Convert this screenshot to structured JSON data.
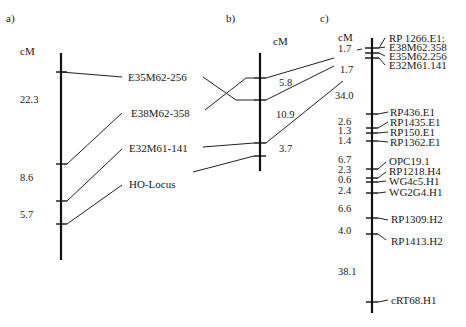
{
  "figure": {
    "panels": [
      {
        "id": "a",
        "label": "a)",
        "unit": "cM",
        "intervals": [
          "22.3",
          "8.6",
          "5.7"
        ],
        "markers": [
          "E35M62-256",
          "E38M62-358",
          "E32M61-141",
          "HO-Locus"
        ]
      },
      {
        "id": "b",
        "label": "b)",
        "unit": "cM",
        "intervals": [
          "5.8",
          "10.9",
          "3.7"
        ]
      },
      {
        "id": "c",
        "label": "c)",
        "unit": "cM",
        "intervals": [
          "1.7",
          "1.7",
          "34.0",
          "2.6",
          "1.3",
          "1.4",
          "6.7",
          "2.3",
          "0.6",
          "2.4",
          "6.6",
          "4.0",
          "38.1"
        ],
        "markers": [
          "RP 1266.E1;",
          "E38M62.358",
          "E35M62.256",
          "E32M61.141",
          "RP436.E1",
          "RP1435.E1",
          "RP150.E1",
          "RP1362.E1",
          "OPC19.1",
          "RP1218.H4",
          "WG4c5.H1",
          "WG2G4.H1",
          "RP1309.H2",
          "RP1413.H2",
          "cRT68.H1"
        ]
      }
    ]
  }
}
